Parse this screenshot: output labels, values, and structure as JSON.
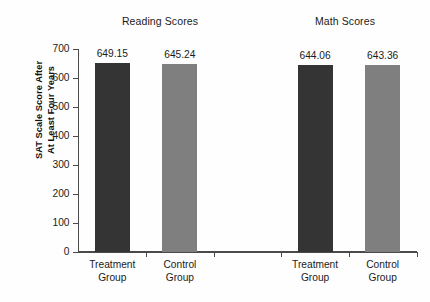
{
  "chart_data": {
    "type": "bar",
    "title": "",
    "xlabel": "",
    "ylabel": "SAT Scale Score After At Least Four Years",
    "ylabel_lines": [
      "SAT Scale Score After",
      "At Least Four Years"
    ],
    "ylim": [
      0,
      700
    ],
    "ytick_step": 100,
    "yticks": [
      0,
      100,
      200,
      300,
      400,
      500,
      600,
      700
    ],
    "ytick_labels": [
      "0",
      "100",
      "200",
      "300",
      "400",
      "500",
      "600",
      "700"
    ],
    "grid": false,
    "legend": null,
    "legend_position": "none",
    "group_titles": [
      "Reading Scores",
      "Math Scores"
    ],
    "categories": [
      "Treatment Group",
      "Control Group",
      "Treatment Group",
      "Control Group"
    ],
    "category_label_lines": [
      [
        "Treatment",
        "Group"
      ],
      [
        "Control",
        "Group"
      ],
      [
        "Treatment",
        "Group"
      ],
      [
        "Control",
        "Group"
      ]
    ],
    "values": [
      649.15,
      645.24,
      644.06,
      643.36
    ],
    "value_labels": [
      "649.15",
      "645.24",
      "644.06",
      "643.36"
    ],
    "bar_colors": [
      "#343434",
      "#7f7f7f",
      "#343434",
      "#7f7f7f"
    ],
    "bars": [
      {
        "group": "Reading Scores",
        "category": "Treatment Group",
        "value": 649.15,
        "label": "649.15",
        "color": "#343434",
        "style": "dark"
      },
      {
        "group": "Reading Scores",
        "category": "Control Group",
        "value": 645.24,
        "label": "645.24",
        "color": "#7f7f7f",
        "style": "light"
      },
      {
        "group": "Math Scores",
        "category": "Treatment Group",
        "value": 644.06,
        "label": "644.06",
        "color": "#343434",
        "style": "dark"
      },
      {
        "group": "Math Scores",
        "category": "Control Group",
        "value": 643.36,
        "label": "643.36",
        "color": "#7f7f7f",
        "style": "light"
      }
    ],
    "axis_color": "#4a4a4a",
    "background_color": "#fefefe"
  }
}
